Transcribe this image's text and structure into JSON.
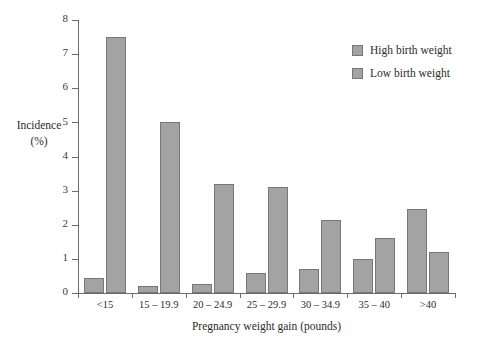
{
  "chart_data": {
    "type": "bar",
    "title": "",
    "xlabel": "Pregnancy weight gain (pounds)",
    "ylabel": "Incidence",
    "ylabel_unit": "(%)",
    "ylim": [
      0,
      8
    ],
    "ytick_step": 1,
    "yticks": [
      "0",
      "1",
      "2",
      "3",
      "4",
      "5",
      "6",
      "7",
      "8"
    ],
    "grid": false,
    "legend_position": "top-right",
    "categories": [
      "<15",
      "15 – 19.9",
      "20 – 24.9",
      "25 – 29.9",
      "30 – 34.9",
      "35 – 40",
      ">40"
    ],
    "series": [
      {
        "name": "High birth weight",
        "color": "#a3a3a3",
        "values": [
          0.45,
          0.2,
          0.25,
          0.6,
          0.7,
          1.0,
          2.45
        ]
      },
      {
        "name": "Low birth weight",
        "color": "#a3a3a3",
        "values": [
          7.5,
          5.0,
          3.2,
          3.1,
          2.15,
          1.6,
          1.2
        ]
      }
    ]
  },
  "legend": {
    "items": [
      {
        "label": "High birth weight"
      },
      {
        "label": "Low birth weight"
      }
    ]
  }
}
